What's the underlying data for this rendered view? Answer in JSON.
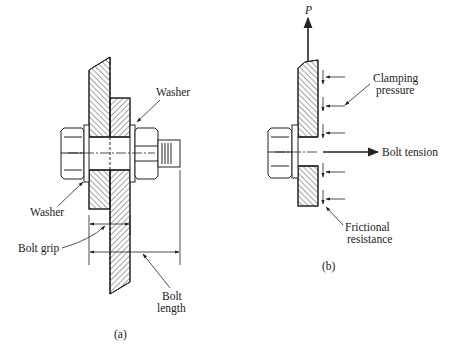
{
  "figure_a": {
    "caption": "(a)",
    "labels": {
      "washer_top": "Washer",
      "washer_left": "Washer",
      "bolt_grip": "Bolt grip",
      "bolt_length_line1": "Bolt",
      "bolt_length_line2": "length"
    }
  },
  "figure_b": {
    "caption": "(b)",
    "labels": {
      "force": "P",
      "clamping_line1": "Clamping",
      "clamping_line2": "pressure",
      "bolt_tension": "Bolt tension",
      "frictional_line1": "Frictional",
      "frictional_line2": "resistance"
    }
  },
  "colors": {
    "ink": "#222222",
    "background": "#ffffff"
  }
}
